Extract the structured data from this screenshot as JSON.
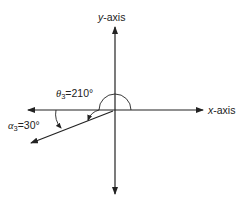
{
  "diagram": {
    "axes": {
      "x_label_var": "x",
      "x_label_rest": "-axis",
      "y_label_var": "y",
      "y_label_rest": "-axis"
    },
    "theta": {
      "symbol": "θ",
      "subscript": "3",
      "value": "=210°"
    },
    "alpha": {
      "symbol": "α",
      "subscript": "3",
      "value": "=30°"
    },
    "colors": {
      "line": "#222222",
      "background": "#ffffff"
    }
  }
}
